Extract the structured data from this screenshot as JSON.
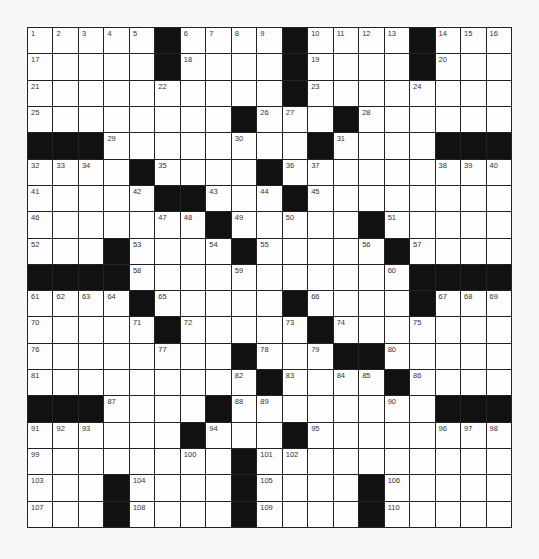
{
  "puzzle": {
    "rows": 19,
    "cols": 19,
    "colors": {
      "black": "#111111",
      "white": "#fdfdfd",
      "line": "#222222",
      "number": "#333333"
    },
    "pattern": [
      ".....#....#....#...",
      ".....#....#....#...",
      "..........#........",
      "........#...#......",
      "###........#....###",
      "....#....#.........",
      ".....##...#........",
      ".......#.....#.....",
      "...#....#.....#....",
      "####...........####",
      "....#.....#....#...",
      ".....#.....#.......",
      "........#...##.....",
      ".........#....#....",
      "###....#........###",
      "......#...#........",
      "........#..........",
      "...#....#....#.....",
      "...#....#....#....."
    ],
    "numbers": [
      {
        "r": 0,
        "c": 0,
        "n": 1
      },
      {
        "r": 0,
        "c": 1,
        "n": 2
      },
      {
        "r": 0,
        "c": 2,
        "n": 3
      },
      {
        "r": 0,
        "c": 3,
        "n": 4
      },
      {
        "r": 0,
        "c": 4,
        "n": 5
      },
      {
        "r": 0,
        "c": 6,
        "n": 6
      },
      {
        "r": 0,
        "c": 7,
        "n": 7
      },
      {
        "r": 0,
        "c": 8,
        "n": 8
      },
      {
        "r": 0,
        "c": 9,
        "n": 9
      },
      {
        "r": 0,
        "c": 11,
        "n": 10
      },
      {
        "r": 0,
        "c": 12,
        "n": 11
      },
      {
        "r": 0,
        "c": 13,
        "n": 12
      },
      {
        "r": 0,
        "c": 14,
        "n": 13
      },
      {
        "r": 0,
        "c": 16,
        "n": 14
      },
      {
        "r": 0,
        "c": 17,
        "n": 15
      },
      {
        "r": 0,
        "c": 18,
        "n": 16
      },
      {
        "r": 1,
        "c": 0,
        "n": 17
      },
      {
        "r": 1,
        "c": 6,
        "n": 18
      },
      {
        "r": 1,
        "c": 11,
        "n": 19
      },
      {
        "r": 1,
        "c": 16,
        "n": 20
      },
      {
        "r": 2,
        "c": 0,
        "n": 21
      },
      {
        "r": 2,
        "c": 5,
        "n": 22
      },
      {
        "r": 2,
        "c": 11,
        "n": 23
      },
      {
        "r": 2,
        "c": 15,
        "n": 24
      },
      {
        "r": 3,
        "c": 0,
        "n": 25
      },
      {
        "r": 3,
        "c": 9,
        "n": 26
      },
      {
        "r": 3,
        "c": 10,
        "n": 27
      },
      {
        "r": 3,
        "c": 13,
        "n": 28
      },
      {
        "r": 4,
        "c": 3,
        "n": 29
      },
      {
        "r": 4,
        "c": 8,
        "n": 30
      },
      {
        "r": 4,
        "c": 12,
        "n": 31
      },
      {
        "r": 5,
        "c": 0,
        "n": 32
      },
      {
        "r": 5,
        "c": 1,
        "n": 33
      },
      {
        "r": 5,
        "c": 2,
        "n": 34
      },
      {
        "r": 5,
        "c": 5,
        "n": 35
      },
      {
        "r": 5,
        "c": 10,
        "n": 36
      },
      {
        "r": 5,
        "c": 11,
        "n": 37
      },
      {
        "r": 5,
        "c": 16,
        "n": 38
      },
      {
        "r": 5,
        "c": 17,
        "n": 39
      },
      {
        "r": 5,
        "c": 18,
        "n": 40
      },
      {
        "r": 6,
        "c": 0,
        "n": 41
      },
      {
        "r": 6,
        "c": 4,
        "n": 42
      },
      {
        "r": 6,
        "c": 7,
        "n": 43
      },
      {
        "r": 6,
        "c": 9,
        "n": 44
      },
      {
        "r": 6,
        "c": 11,
        "n": 45
      },
      {
        "r": 7,
        "c": 0,
        "n": 46
      },
      {
        "r": 7,
        "c": 5,
        "n": 47
      },
      {
        "r": 7,
        "c": 6,
        "n": 48
      },
      {
        "r": 7,
        "c": 8,
        "n": 49
      },
      {
        "r": 7,
        "c": 10,
        "n": 50
      },
      {
        "r": 7,
        "c": 14,
        "n": 51
      },
      {
        "r": 8,
        "c": 0,
        "n": 52
      },
      {
        "r": 8,
        "c": 4,
        "n": 53
      },
      {
        "r": 8,
        "c": 7,
        "n": 54
      },
      {
        "r": 8,
        "c": 9,
        "n": 55
      },
      {
        "r": 8,
        "c": 13,
        "n": 56
      },
      {
        "r": 8,
        "c": 15,
        "n": 57
      },
      {
        "r": 9,
        "c": 4,
        "n": 58
      },
      {
        "r": 9,
        "c": 8,
        "n": 59
      },
      {
        "r": 9,
        "c": 14,
        "n": 60
      },
      {
        "r": 10,
        "c": 0,
        "n": 61
      },
      {
        "r": 10,
        "c": 1,
        "n": 62
      },
      {
        "r": 10,
        "c": 2,
        "n": 63
      },
      {
        "r": 10,
        "c": 3,
        "n": 64
      },
      {
        "r": 10,
        "c": 5,
        "n": 65
      },
      {
        "r": 10,
        "c": 11,
        "n": 66
      },
      {
        "r": 10,
        "c": 16,
        "n": 67
      },
      {
        "r": 10,
        "c": 17,
        "n": 68
      },
      {
        "r": 10,
        "c": 18,
        "n": 69
      },
      {
        "r": 11,
        "c": 0,
        "n": 70
      },
      {
        "r": 11,
        "c": 4,
        "n": 71
      },
      {
        "r": 11,
        "c": 6,
        "n": 72
      },
      {
        "r": 11,
        "c": 10,
        "n": 73
      },
      {
        "r": 11,
        "c": 12,
        "n": 74
      },
      {
        "r": 11,
        "c": 15,
        "n": 75
      },
      {
        "r": 12,
        "c": 0,
        "n": 76
      },
      {
        "r": 12,
        "c": 5,
        "n": 77
      },
      {
        "r": 12,
        "c": 9,
        "n": 78
      },
      {
        "r": 12,
        "c": 11,
        "n": 79
      },
      {
        "r": 12,
        "c": 14,
        "n": 80
      },
      {
        "r": 13,
        "c": 0,
        "n": 81
      },
      {
        "r": 13,
        "c": 8,
        "n": 82
      },
      {
        "r": 13,
        "c": 10,
        "n": 83
      },
      {
        "r": 13,
        "c": 12,
        "n": 84
      },
      {
        "r": 13,
        "c": 13,
        "n": 85
      },
      {
        "r": 13,
        "c": 15,
        "n": 86
      },
      {
        "r": 14,
        "c": 3,
        "n": 87
      },
      {
        "r": 14,
        "c": 8,
        "n": 88
      },
      {
        "r": 14,
        "c": 9,
        "n": 89
      },
      {
        "r": 14,
        "c": 14,
        "n": 90
      },
      {
        "r": 15,
        "c": 0,
        "n": 91
      },
      {
        "r": 15,
        "c": 1,
        "n": 92
      },
      {
        "r": 15,
        "c": 2,
        "n": 93
      },
      {
        "r": 15,
        "c": 7,
        "n": 94
      },
      {
        "r": 15,
        "c": 11,
        "n": 95
      },
      {
        "r": 15,
        "c": 16,
        "n": 96
      },
      {
        "r": 15,
        "c": 17,
        "n": 97
      },
      {
        "r": 15,
        "c": 18,
        "n": 98
      },
      {
        "r": 16,
        "c": 0,
        "n": 99
      },
      {
        "r": 16,
        "c": 6,
        "n": 100
      },
      {
        "r": 16,
        "c": 9,
        "n": 101
      },
      {
        "r": 16,
        "c": 10,
        "n": 102
      },
      {
        "r": 17,
        "c": 0,
        "n": 103
      },
      {
        "r": 17,
        "c": 4,
        "n": 104
      },
      {
        "r": 17,
        "c": 9,
        "n": 105
      },
      {
        "r": 17,
        "c": 14,
        "n": 106
      },
      {
        "r": 18,
        "c": 0,
        "n": 107
      },
      {
        "r": 18,
        "c": 4,
        "n": 108
      },
      {
        "r": 18,
        "c": 9,
        "n": 109
      },
      {
        "r": 18,
        "c": 14,
        "n": 110
      }
    ],
    "letters": []
  }
}
